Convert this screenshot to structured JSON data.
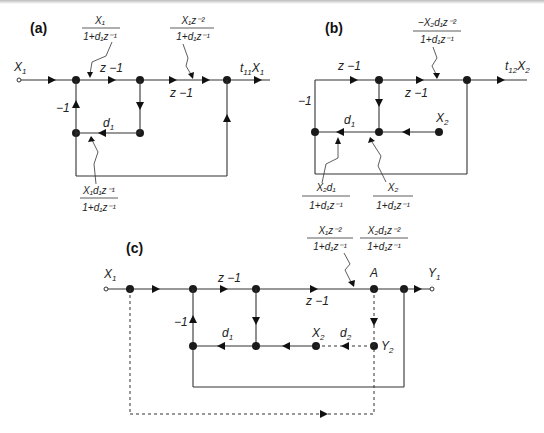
{
  "panels": {
    "a": {
      "label": "(a)",
      "input": "X",
      "input_sub": "1",
      "output_t": "t",
      "output_t_sub": "11",
      "output_x": "X",
      "output_x_sub": "1",
      "gain_z1_top": "z −1",
      "gain_z1_mid": "z −1",
      "gain_neg1": "−1",
      "gain_d1": "d",
      "gain_d1_sub": "1",
      "annot_top1_num": "X₁",
      "annot_top1_den": "1+d₁z⁻¹",
      "annot_top2_num": "X₁z⁻²",
      "annot_top2_den": "1+d₁z⁻¹",
      "annot_bottom_num": "X₁d₁z⁻¹",
      "annot_bottom_den": "1+d₁z⁻¹"
    },
    "b": {
      "label": "(b)",
      "output_t": "t",
      "output_t_sub": "12",
      "output_x": "X",
      "output_x_sub": "2",
      "input": "X",
      "input_sub": "2",
      "gain_z1_top": "z −1",
      "gain_z1_mid": "z −1",
      "gain_neg1": "−1",
      "gain_d1": "d",
      "gain_d1_sub": "1",
      "annot_top_num": "−X₂d₁z⁻²",
      "annot_top_den": "1+d₁z⁻¹",
      "annot_bl_num": "X₂d₁",
      "annot_bl_den": "1+d₁z⁻¹",
      "annot_br_num": "X₂",
      "annot_br_den": "1+d₁z⁻¹"
    },
    "c": {
      "label": "(c)",
      "input": "X",
      "input_sub": "1",
      "output": "Y",
      "output_sub": "1",
      "node_a": "A",
      "node_y2": "Y",
      "node_y2_sub": "2",
      "node_x2": "X",
      "node_x2_sub": "2",
      "gain_z1_top": "z −1",
      "gain_z1_mid": "z −1",
      "gain_neg1": "−1",
      "gain_d1": "d",
      "gain_d1_sub": "1",
      "gain_d2": "d",
      "gain_d2_sub": "2",
      "annot1_num": "X₁z⁻²",
      "annot1_den": "1+d₁z⁻¹",
      "annot2_num": "X₂d₁z⁻²",
      "annot2_den": "1+d₁z⁻¹"
    }
  }
}
